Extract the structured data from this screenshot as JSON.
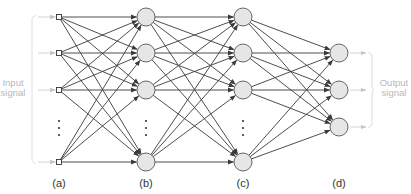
{
  "diagram": {
    "type": "feedforward neural network",
    "colors": {
      "edge": "#3a3a3a",
      "node_fill": "#e6e6e6",
      "node_stroke": "#555555",
      "signal": "#bbbbbb"
    },
    "input_signal_label": [
      "Input",
      "signal"
    ],
    "output_signal_label": [
      "Output",
      "signal"
    ],
    "layers": [
      {
        "id": "a",
        "label": "(a)",
        "kind": "input",
        "x": 59,
        "nodes": [
          17,
          53,
          90,
          162
        ],
        "ellipsis_after": 2
      },
      {
        "id": "b",
        "label": "(b)",
        "kind": "hidden",
        "x": 146,
        "nodes": [
          17,
          53,
          90,
          162
        ],
        "ellipsis_after": 2
      },
      {
        "id": "c",
        "label": "(c)",
        "kind": "hidden",
        "x": 243,
        "nodes": [
          17,
          53,
          90,
          162
        ],
        "ellipsis_after": 2
      },
      {
        "id": "d",
        "label": "(d)",
        "kind": "output",
        "x": 339,
        "nodes": [
          53,
          90,
          127
        ]
      }
    ]
  }
}
